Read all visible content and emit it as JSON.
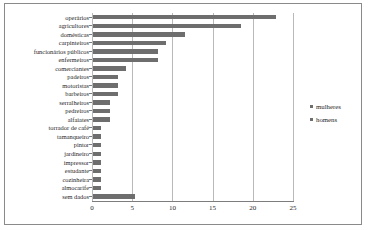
{
  "chart": {
    "title": "",
    "xlabel": "",
    "ylabel": ""
  },
  "legend": {
    "position": "right",
    "items": [
      {
        "label": "mulheres",
        "color": "#6e6e6e",
        "marker": "square-marker"
      },
      {
        "label": "homens",
        "color": "#6e6e6e",
        "marker": "square-marker"
      }
    ]
  },
  "axis": {
    "x_ticks": [
      "0",
      "5",
      "10",
      "15",
      "20",
      "25"
    ],
    "x_min": 0,
    "x_max": 25,
    "grid": true
  },
  "chart_data": {
    "type": "bar",
    "orientation": "horizontal",
    "title": "",
    "xlabel": "",
    "ylabel": "",
    "xlim": [
      0,
      25
    ],
    "grid": true,
    "legend_position": "right",
    "legend": [
      "mulheres",
      "homens"
    ],
    "categories": [
      "operários",
      "agricultores",
      "domésticas",
      "carpinteiros",
      "funcionários públicos",
      "enfermeiros",
      "comerciantes",
      "padeiros",
      "motoristas",
      "barbeiros",
      "serralheiros",
      "pedreiros",
      "alfaiates",
      "torrador de café",
      "tamanqueiro",
      "pintor",
      "jardineiro",
      "impressor",
      "estudante",
      "cozinheira",
      "almocarife",
      "sem dados"
    ],
    "values": [
      22.7,
      18.4,
      11.4,
      9.1,
      8.1,
      8.1,
      4.1,
      3.1,
      3.1,
      3.1,
      2.1,
      2.1,
      2.1,
      1.0,
      1.0,
      1.0,
      1.0,
      1.0,
      1.0,
      1.0,
      1.0,
      5.2
    ],
    "series": [
      {
        "name": "homens",
        "values": [
          22.7,
          18.4,
          11.4,
          9.1,
          8.1,
          8.1,
          4.1,
          3.1,
          3.1,
          3.1,
          2.1,
          2.1,
          2.1,
          1.0,
          1.0,
          1.0,
          1.0,
          1.0,
          1.0,
          1.0,
          1.0,
          5.2
        ]
      }
    ],
    "bar_color": "#6e6e6e"
  }
}
